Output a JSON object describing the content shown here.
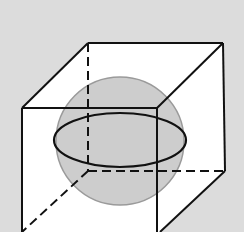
{
  "diagram": {
    "colors": {
      "background": "#dcdcdc",
      "cube_face": "#ffffff",
      "sphere_fill": "#c4c4c4",
      "sphere_stroke": "#9a9a9a",
      "edge": "#111111"
    },
    "cube": {
      "back_top_left": [
        88,
        43
      ],
      "back_top_right": [
        223,
        43
      ],
      "back_bottom_left": [
        88,
        171
      ],
      "back_bottom_right": [
        225,
        171
      ],
      "front_top_left": [
        22,
        108
      ],
      "front_top_right": [
        157,
        108
      ]
    },
    "sphere": {
      "cx": 120,
      "cy": 141,
      "r": 64
    },
    "equator": {
      "cx": 120,
      "cy": 140,
      "rx": 66,
      "ry": 27
    }
  }
}
